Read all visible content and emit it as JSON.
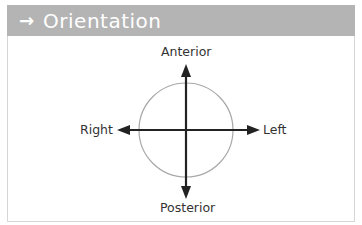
{
  "header": {
    "icon": "right-arrow-icon",
    "icon_glyph": "→",
    "title": "Orientation",
    "background_color": "#b4b4b4",
    "text_color": "#ffffff"
  },
  "diagram": {
    "labels": {
      "top": "Anterior",
      "bottom": "Posterior",
      "left": "Right",
      "right": "Left"
    },
    "circle_color": "#a8a8a8",
    "axis_color": "#222222"
  }
}
